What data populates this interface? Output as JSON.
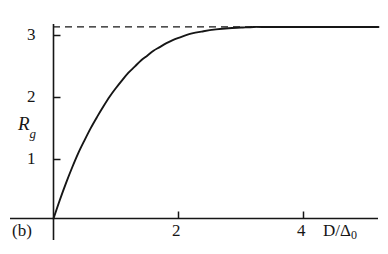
{
  "figure": {
    "panel_label": "(b)",
    "background_color": "#ffffff",
    "ink_color": "#161616"
  },
  "axes": {
    "y_title_main": "R",
    "y_title_sub": "g",
    "x_title_numerator": "D/",
    "x_title_delta": "Δ",
    "x_title_sub": "0",
    "y_ticks": [
      "1",
      "2",
      "3"
    ],
    "x_ticks": [
      "2",
      "4"
    ]
  },
  "chart_data": {
    "type": "line",
    "title": "",
    "subtitle": "",
    "xlabel": "D/Δ0",
    "ylabel": "Rg",
    "xlim": [
      0,
      5.2
    ],
    "ylim": [
      0,
      3.35
    ],
    "xticks": [
      2,
      4
    ],
    "yticks": [
      1,
      2,
      3
    ],
    "grid": false,
    "legend": null,
    "series": [
      {
        "name": "Rg(D/Δ0)",
        "style": "solid",
        "color": "#161616",
        "x": [
          0.0,
          0.1,
          0.2,
          0.3,
          0.4,
          0.5,
          0.6,
          0.7,
          0.8,
          0.9,
          1.0,
          1.1,
          1.2,
          1.3,
          1.4,
          1.5,
          1.6,
          1.7,
          1.8,
          1.9,
          2.0,
          2.2,
          2.4,
          2.6,
          2.8,
          3.0,
          3.2,
          3.4,
          3.6,
          3.8,
          4.0,
          4.2,
          4.4,
          4.6,
          4.8,
          5.0,
          5.2
        ],
        "y": [
          0.0,
          0.3,
          0.58,
          0.84,
          1.08,
          1.29,
          1.49,
          1.67,
          1.84,
          2.0,
          2.14,
          2.27,
          2.39,
          2.49,
          2.59,
          2.67,
          2.75,
          2.81,
          2.87,
          2.92,
          2.96,
          3.03,
          3.07,
          3.1,
          3.12,
          3.13,
          3.14,
          3.14,
          3.14,
          3.14,
          3.14,
          3.14,
          3.14,
          3.14,
          3.14,
          3.14,
          3.14
        ]
      },
      {
        "name": "asymptote",
        "style": "dashed",
        "color": "#161616",
        "x": [
          0.0,
          5.2
        ],
        "y": [
          3.14,
          3.14
        ],
        "annotation": "horizontal asymptote at Rg = π ≈ 3.14"
      }
    ],
    "annotations": [
      {
        "text": "(b)",
        "position": "bottom-left outside axes"
      }
    ]
  }
}
